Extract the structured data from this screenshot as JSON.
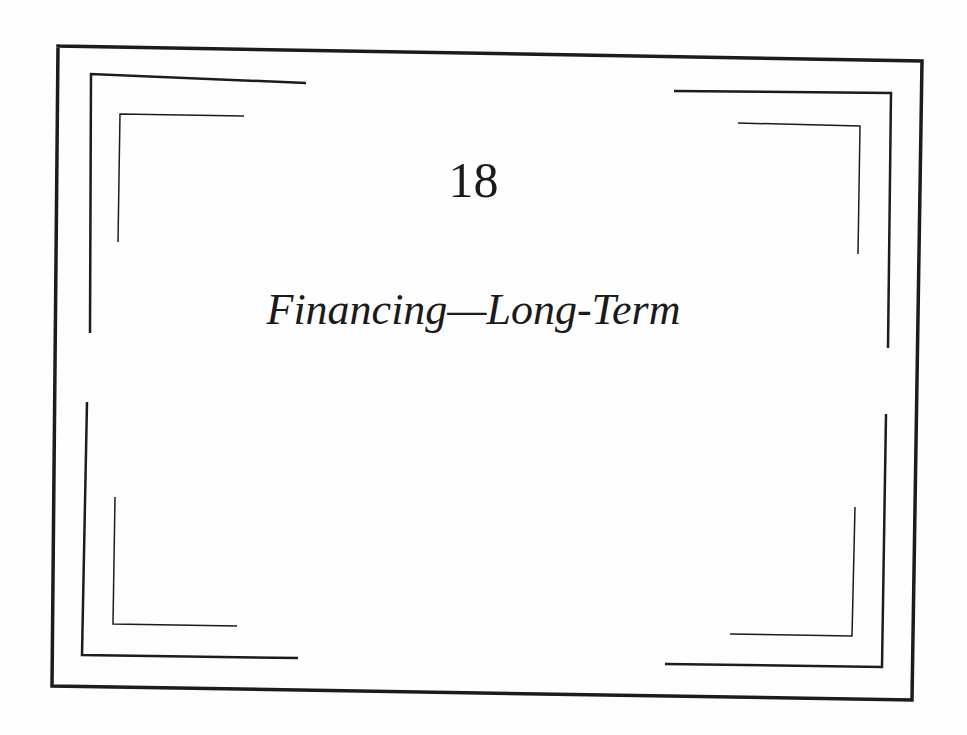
{
  "chapter": {
    "number": "18",
    "title": "Financing—Long-Term"
  },
  "frame": {
    "line_color": "#1c1c1c",
    "outer_border": {
      "points": [
        [
          58,
          46
        ],
        [
          922,
          61
        ],
        [
          912,
          700
        ],
        [
          52,
          686
        ],
        [
          58,
          46
        ]
      ],
      "stroke_width": 3.5
    },
    "middle_brackets": {
      "stroke_width": 2.5,
      "top_left": [
        [
          90,
          333
        ],
        [
          91,
          74
        ],
        [
          306,
          83
        ]
      ],
      "top_right": [
        [
          674,
          91
        ],
        [
          891,
          93
        ],
        [
          888,
          348
        ]
      ],
      "bottom_left": [
        [
          87,
          402
        ],
        [
          82,
          655
        ],
        [
          298,
          658
        ]
      ],
      "bottom_right": [
        [
          665,
          664
        ],
        [
          882,
          667
        ],
        [
          886,
          414
        ]
      ]
    },
    "inner_brackets": {
      "stroke_width": 1.5,
      "top_left": [
        [
          118,
          242
        ],
        [
          120,
          114
        ],
        [
          244,
          116
        ]
      ],
      "top_right": [
        [
          738,
          123
        ],
        [
          860,
          126
        ],
        [
          858,
          254
        ]
      ],
      "bottom_left": [
        [
          115,
          497
        ],
        [
          113,
          624
        ],
        [
          237,
          626
        ]
      ],
      "bottom_right": [
        [
          730,
          634
        ],
        [
          852,
          636
        ],
        [
          855,
          507
        ]
      ]
    }
  }
}
